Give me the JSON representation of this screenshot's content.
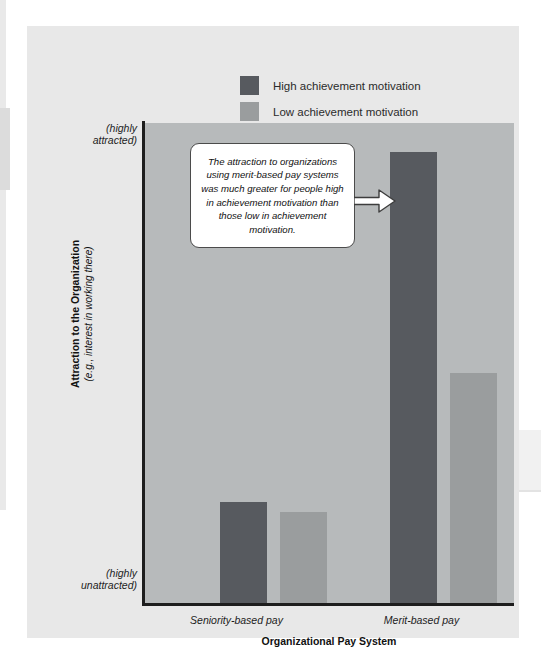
{
  "figure": {
    "legend": {
      "position": "top-center",
      "items": [
        {
          "label": "High achievement motivation",
          "color": "#575a5f",
          "swatch_name": "legend-swatch-high"
        },
        {
          "label": "Low achievement motivation",
          "color": "#9a9d9e",
          "swatch_name": "legend-swatch-low"
        }
      ]
    },
    "y_axis": {
      "top_label": "(highly\nattracted)",
      "top_label_line1": "(highly",
      "top_label_line2": "attracted)",
      "bottom_label_line1": "(highly",
      "bottom_label_line2": "unattracted)",
      "title_main": "Attraction to the Organization",
      "title_sub": "(e.g., interest in working there)"
    },
    "x_axis": {
      "title": "Organizational Pay System",
      "categories": [
        "Seniority-based pay",
        "Merit-based pay"
      ]
    },
    "annotation": {
      "text": "The attraction to organizations using merit-based pay systems was much greater for people high in achievement motivation than those low in achievement motivation.",
      "arrow_direction": "right",
      "points_to": "Merit-based pay / High achievement motivation bar"
    },
    "colors": {
      "series_high": "#575a5f",
      "series_low": "#9a9d9e",
      "plot_background": "#b7babb",
      "card_background": "#e8e8e8",
      "axis": "#1d1d1d",
      "callout_border": "#4b4b4b",
      "callout_fill": "#ffffff"
    }
  },
  "chart_data": {
    "type": "bar",
    "title": "",
    "xlabel": "Organizational Pay System",
    "ylabel": "Attraction to the Organization (e.g., interest in working there)",
    "categories": [
      "Seniority-based pay",
      "Merit-based pay"
    ],
    "series": [
      {
        "name": "High achievement motivation",
        "color": "#575a5f",
        "values": [
          21,
          94
        ]
      },
      {
        "name": "Low achievement motivation",
        "color": "#9a9d9e",
        "values": [
          19,
          48
        ]
      }
    ],
    "ylim": [
      0,
      100
    ],
    "ytick_labels": [
      "(highly unattracted)",
      "(highly attracted)"
    ],
    "ytick_values": [
      0,
      100
    ],
    "grid": false,
    "legend_position": "top-center",
    "annotations": [
      {
        "text": "The attraction to organizations using merit-based pay systems was much greater for people high in achievement motivation than those low in achievement motivation.",
        "target_category": "Merit-based pay",
        "target_series": "High achievement motivation"
      }
    ]
  }
}
